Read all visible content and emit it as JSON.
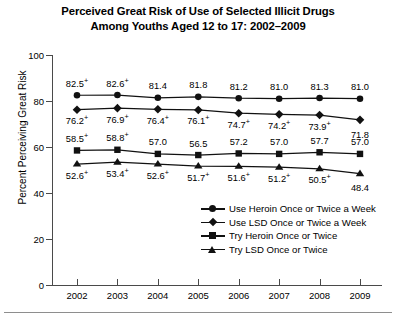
{
  "title": {
    "line1": "Perceived Great Risk of Use of Selected Illicit Drugs",
    "line2": "Among Youths Aged 12 to 17: 2002–2009"
  },
  "axes": {
    "ylabel": "Percent Perceiving Great Risk",
    "yticks": [
      "0",
      "20",
      "40",
      "60",
      "80",
      "100"
    ],
    "xticks": [
      "2002",
      "2003",
      "2004",
      "2005",
      "2006",
      "2007",
      "2008",
      "2009"
    ]
  },
  "legend": {
    "items": [
      {
        "label": "Use Heroin Once or Twice a Week",
        "marker": "circle-marker"
      },
      {
        "label": "Use LSD Once or Twice a Week",
        "marker": "diamond-marker"
      },
      {
        "label": "Try Heroin Once or Twice",
        "marker": "square-marker"
      },
      {
        "label": "Try LSD Once or Twice",
        "marker": "triangle-marker"
      }
    ]
  },
  "chart_data": {
    "type": "line",
    "title": "Perceived Great Risk of Use of Selected Illicit Drugs Among Youths Aged 12 to 17: 2002–2009",
    "xlabel": "",
    "ylabel": "Percent Perceiving Great Risk",
    "x": [
      "2002",
      "2003",
      "2004",
      "2005",
      "2006",
      "2007",
      "2008",
      "2009"
    ],
    "ylim": [
      0,
      100
    ],
    "ytick_step": 20,
    "grid": false,
    "legend_position": "inside lower-right",
    "significance_marker": "+",
    "series": [
      {
        "name": "Use Heroin Once or Twice a Week",
        "marker": "circle",
        "label_position": "above",
        "values": [
          82.5,
          82.6,
          81.4,
          81.8,
          81.2,
          81.0,
          81.3,
          81.0
        ],
        "labels": [
          "82.5",
          "82.6",
          "81.4",
          "81.8",
          "81.2",
          "81.0",
          "81.3",
          "81.0"
        ],
        "significant": [
          true,
          true,
          false,
          false,
          false,
          false,
          false,
          false
        ]
      },
      {
        "name": "Use LSD Once or Twice a Week",
        "marker": "diamond",
        "label_position": "below",
        "values": [
          76.2,
          76.9,
          76.4,
          76.1,
          74.7,
          74.2,
          73.9,
          71.8
        ],
        "labels": [
          "76.2",
          "76.9",
          "76.4",
          "76.1",
          "74.7",
          "74.2",
          "73.9",
          "71.8"
        ],
        "significant": [
          true,
          true,
          true,
          true,
          true,
          true,
          true,
          false
        ]
      },
      {
        "name": "Try Heroin Once or Twice",
        "marker": "square",
        "label_position": "above",
        "values": [
          58.5,
          58.8,
          57.0,
          56.5,
          57.2,
          57.0,
          57.7,
          57.0
        ],
        "labels": [
          "58.5",
          "58.8",
          "57.0",
          "56.5",
          "57.2",
          "57.0",
          "57.7",
          "57.0"
        ],
        "significant": [
          true,
          true,
          false,
          false,
          false,
          false,
          false,
          false
        ]
      },
      {
        "name": "Try LSD Once or Twice",
        "marker": "triangle",
        "label_position": "below",
        "values": [
          52.6,
          53.4,
          52.6,
          51.7,
          51.6,
          51.2,
          50.5,
          48.4
        ],
        "labels": [
          "52.6",
          "53.4",
          "52.6",
          "51.7",
          "51.6",
          "51.2",
          "50.5",
          "48.4"
        ],
        "significant": [
          true,
          true,
          true,
          true,
          true,
          true,
          true,
          false
        ]
      }
    ]
  }
}
